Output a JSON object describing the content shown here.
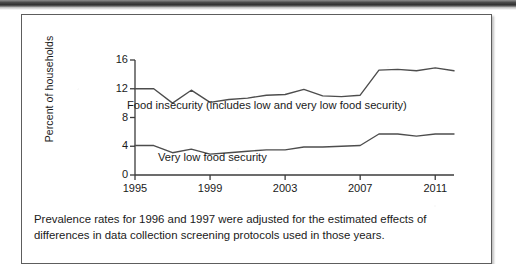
{
  "figure": {
    "caption_lines": [
      "Prevalence rates for 1996 and 1997 were adjusted for the estimated effects of",
      "differences in data collection screening protocols used in those years."
    ]
  },
  "chart_data": {
    "type": "line",
    "title": "",
    "xlabel": "",
    "ylabel": "Percent of households",
    "xlim": [
      1995,
      2012
    ],
    "ylim": [
      0,
      16
    ],
    "ytick_labels": [
      "0",
      "4",
      "8",
      "12",
      "16"
    ],
    "yticks": [
      0,
      4,
      8,
      12,
      16
    ],
    "xtick_labels": [
      "1995",
      "1999",
      "2003",
      "2007",
      "2011"
    ],
    "xticks": [
      1995,
      1999,
      2003,
      2007,
      2011
    ],
    "grid": false,
    "legend_position": "inline-annotation",
    "line_color": "#4d4d4d",
    "x": [
      1995,
      1996,
      1997,
      1998,
      1999,
      2000,
      2001,
      2002,
      2003,
      2004,
      2005,
      2006,
      2007,
      2008,
      2009,
      2010,
      2011,
      2012
    ],
    "series": [
      {
        "name": "Food insecurity (includes low and very low food security)",
        "values": [
          12.0,
          12.0,
          10.0,
          11.8,
          10.1,
          10.5,
          10.7,
          11.1,
          11.2,
          11.9,
          11.0,
          10.9,
          11.1,
          14.6,
          14.7,
          14.5,
          14.9,
          14.5
        ]
      },
      {
        "name": "Very low food security",
        "values": [
          4.1,
          4.1,
          3.1,
          3.6,
          2.9,
          3.1,
          3.3,
          3.5,
          3.5,
          3.9,
          3.9,
          4.0,
          4.1,
          5.7,
          5.7,
          5.4,
          5.7,
          5.7
        ]
      }
    ],
    "annotations": [
      {
        "text": "Food insecurity (includes low and very low food security)",
        "series": "Food insecurity (includes low and very low food security)"
      },
      {
        "text": "Very low food security",
        "series": "Very low food security"
      }
    ]
  }
}
